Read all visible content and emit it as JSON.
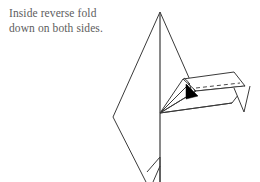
{
  "page": {
    "width": 260,
    "height": 182,
    "background": "#ffffff"
  },
  "caption": {
    "text": "Inside reverse fold\ndown on both sides.",
    "line_1": "Inside reverse fold",
    "line_2": "down on both sides.",
    "color": "#5d5d5d"
  },
  "diagram": {
    "line_color": "#3a3a3a",
    "fold_line_color": "#4a4a4a",
    "arrow_color": "#000000",
    "fill_color": "#ffffff",
    "body": {
      "name": "airplane-body-outline",
      "points": "160,12 113,117 146,182 160,182 160,12"
    },
    "body_right_edge": {
      "name": "body-right-edge",
      "points": "160,12 201,105"
    },
    "spine": {
      "name": "center-spine-line",
      "points": "160,12 160,182"
    },
    "wing_top_panel": {
      "name": "wing-upper-panel",
      "points": "160,113 183,79 234,72 245,86 196,91"
    },
    "wing_lower_panel": {
      "name": "wing-lower-panel",
      "points": "160,113 196,91 245,86 232,103"
    },
    "wing_hinge_fan": {
      "name": "wing-hinge-fan-lines",
      "lines": [
        "160,113 183,79",
        "160,113 190,83",
        "160,113 196,91",
        "160,113 232,103",
        "160,113 245,86"
      ]
    },
    "wing_tip_notch": {
      "name": "wing-tip-v-notch",
      "points": "234,88 244,112 249,86"
    },
    "fold_crease_curve": {
      "name": "fold-crease-curve",
      "path": "M 184,78 C 190,82 192,88 191,96"
    },
    "dashed_fold_line": {
      "name": "dashed-fold-line",
      "points": "196,88 240,83",
      "style": "dashed"
    },
    "fold_arrow": {
      "name": "fold-direction-arrow",
      "points": "186,85 196,96 186,98",
      "direction": "right-down"
    },
    "bottom_tab": {
      "name": "bottom-tail-tab",
      "points": "148,170 160,156 160,182 152,182"
    }
  }
}
